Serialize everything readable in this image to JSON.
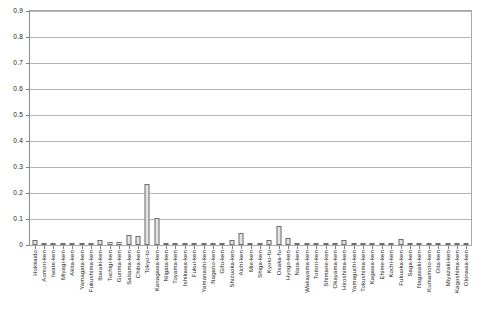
{
  "chart_data": {
    "type": "bar",
    "title": "",
    "subtitle": "",
    "xlabel": "",
    "ylabel": "",
    "ylim": [
      0,
      0.9
    ],
    "grid": true,
    "legend": false,
    "y_ticks": [
      "0",
      "0.1",
      "0.2",
      "0.3",
      "0.4",
      "0.5",
      "0.6",
      "0.7",
      "0.8",
      "0.9"
    ],
    "y_tick_values": [
      0,
      0.1,
      0.2,
      0.3,
      0.4,
      0.5,
      0.6,
      0.7,
      0.8,
      0.9
    ],
    "categories": [
      "Hokkaido",
      "Aomori-ken",
      "Iwate-ken",
      "Miyagi-ken",
      "Akita-ken",
      "Yamagata-ken",
      "Fukushima-ken",
      "Ibaraki-ken",
      "Tochigi-ken",
      "Gunma-ken",
      "Saitama-ken",
      "Chiba-ken",
      "Tokyo-to",
      "Kanagawa-ken",
      "Niigata-ken",
      "Toyama-ken",
      "Ishikawa-ken",
      "Fukui-ken",
      "Yamanashi-ken",
      "Nagano-ken",
      "Gifu-ken",
      "Shizuoka-ken",
      "Aichi-ken",
      "Mie-ken",
      "Shiga-ken",
      "Kyoto-fu",
      "Osaka-fu",
      "Hyogo-ken",
      "Nara-ken",
      "Wakayama-ken",
      "Tottori-ken",
      "Shimane-ken",
      "Okayama-ken",
      "Hiroshima-ken",
      "Yamaguchi-ken",
      "Tokushima-ken",
      "Kagawa-ken",
      "Ehime-ken",
      "Kochi-ken",
      "Fukuoka-ken",
      "Saga-ken",
      "Nagasaki-ken",
      "Kumamoto-ken",
      "Oita-ken",
      "Miyazaki-ken",
      "Kagoshima-ken",
      "Okinawa-ken"
    ],
    "values": [
      0.019,
      0.004,
      0.004,
      0.009,
      0.003,
      0.004,
      0.008,
      0.019,
      0.013,
      0.013,
      0.038,
      0.036,
      0.235,
      0.105,
      0.008,
      0.004,
      0.005,
      0.003,
      0.005,
      0.008,
      0.009,
      0.018,
      0.047,
      0.008,
      0.008,
      0.019,
      0.073,
      0.028,
      0.005,
      0.003,
      0.002,
      0.002,
      0.009,
      0.019,
      0.005,
      0.003,
      0.004,
      0.005,
      0.003,
      0.023,
      0.003,
      0.004,
      0.005,
      0.004,
      0.003,
      0.004,
      0.005
    ],
    "bar_color": "#e4e4e4",
    "bar_border_color": "#6e6e6e",
    "grid_color": "#b4b4b4",
    "axis_color": "#8c8c8c"
  }
}
